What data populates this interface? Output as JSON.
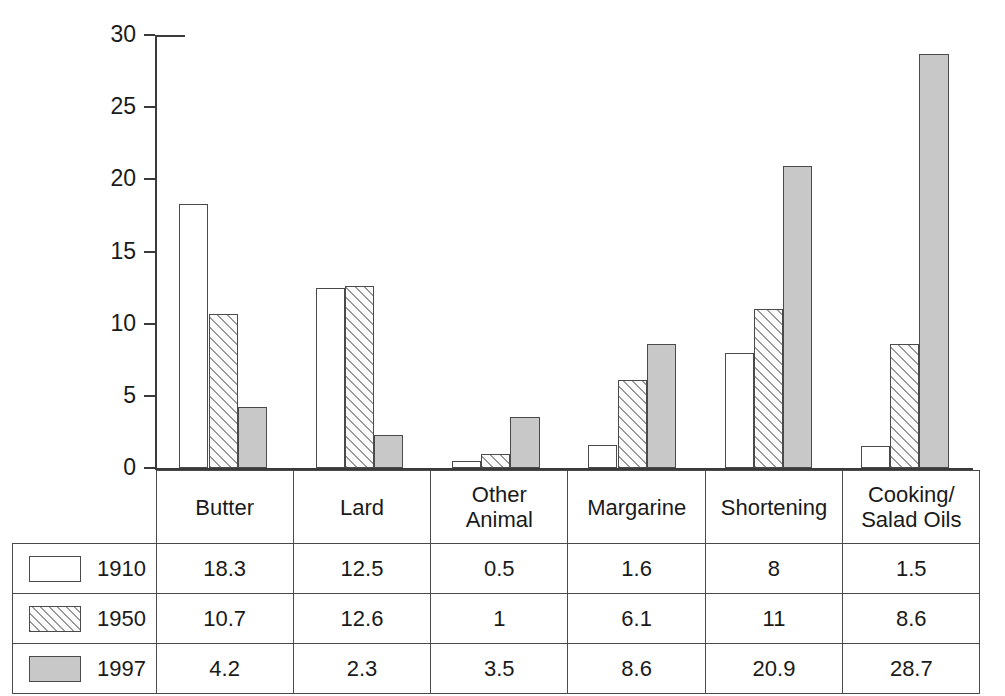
{
  "chart_data": {
    "type": "bar",
    "title": "",
    "subtitle": "",
    "xlabel": "",
    "ylabel": "",
    "ylim": [
      0,
      30
    ],
    "ytick_values": [
      0,
      5,
      10,
      15,
      20,
      25,
      30
    ],
    "ytick_labels": [
      "0",
      "5",
      "10",
      "15",
      "20",
      "25",
      "30"
    ],
    "grid": false,
    "legend_position": "table-left-column",
    "categories": [
      "Butter",
      "Lard",
      "Other Animal",
      "Margarine",
      "Shortening",
      "Cooking/Salad Oils"
    ],
    "category_lines": [
      [
        "Butter"
      ],
      [
        "Lard"
      ],
      [
        "Other",
        "Animal"
      ],
      [
        "Margarine"
      ],
      [
        "Shortening"
      ],
      [
        "Cooking/",
        "Salad Oils"
      ]
    ],
    "series": [
      {
        "name": "1910",
        "fill": "white",
        "values": [
          18.3,
          12.5,
          0.5,
          1.6,
          8,
          1.5
        ],
        "labels": [
          "18.3",
          "12.5",
          "0.5",
          "1.6",
          "8",
          "1.5"
        ]
      },
      {
        "name": "1950",
        "fill": "hatched",
        "values": [
          10.7,
          12.6,
          1,
          6.1,
          11,
          8.6
        ],
        "labels": [
          "10.7",
          "12.6",
          "1",
          "6.1",
          "11",
          "8.6"
        ]
      },
      {
        "name": "1997",
        "fill": "gray",
        "values": [
          4.2,
          2.3,
          3.5,
          8.6,
          20.9,
          28.7
        ],
        "labels": [
          "4.2",
          "2.3",
          "3.5",
          "8.6",
          "20.9",
          "28.7"
        ]
      }
    ]
  },
  "colors": {
    "series_1910": "#ffffff",
    "series_1950": "#fbfbfb",
    "series_1997": "#c8c8c8",
    "outline": "#4a4a4a",
    "axis": "#3a3a3a",
    "text": "#1a1a1a",
    "background": "#ffffff"
  }
}
